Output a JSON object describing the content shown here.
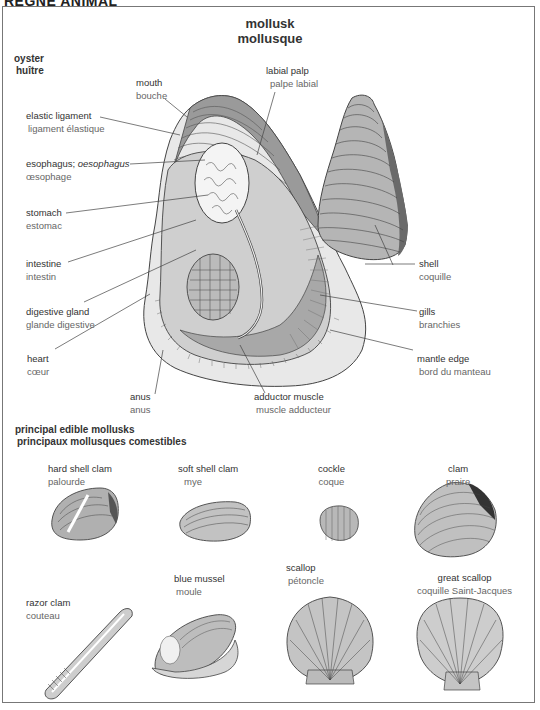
{
  "header": {
    "section": "RÈGNE ANIMAL"
  },
  "title": {
    "en": "mollusk",
    "fr": "mollusque"
  },
  "oyster": {
    "heading": {
      "en": "oyster",
      "fr": "huître"
    },
    "labels": [
      {
        "id": "mouth",
        "en": "mouth",
        "fr": "bouche"
      },
      {
        "id": "labial-palp",
        "en": "labial palp",
        "fr": "palpe labial"
      },
      {
        "id": "elastic-ligament",
        "en": "elastic ligament",
        "fr": "ligament élastique"
      },
      {
        "id": "esophagus",
        "en": "esophagus;",
        "en_alt": "oesophagus",
        "fr": "œsophage"
      },
      {
        "id": "stomach",
        "en": "stomach",
        "fr": "estomac"
      },
      {
        "id": "intestine",
        "en": "intestine",
        "fr": "intestin"
      },
      {
        "id": "digestive-gland",
        "en": "digestive gland",
        "fr": "glande digestive"
      },
      {
        "id": "heart",
        "en": "heart",
        "fr": "cœur"
      },
      {
        "id": "anus",
        "en": "anus",
        "fr": "anus"
      },
      {
        "id": "adductor-muscle",
        "en": "adductor muscle",
        "fr": "muscle adducteur"
      },
      {
        "id": "shell",
        "en": "shell",
        "fr": "coquille"
      },
      {
        "id": "gills",
        "en": "gills",
        "fr": "branchies"
      },
      {
        "id": "mantle-edge",
        "en": "mantle edge",
        "fr": "bord du manteau"
      }
    ]
  },
  "edible": {
    "heading": {
      "en": "principal edible mollusks",
      "fr": "principaux mollusques comestibles"
    },
    "items": [
      {
        "id": "hard-shell-clam",
        "en": "hard shell clam",
        "fr": "palourde"
      },
      {
        "id": "soft-shell-clam",
        "en": "soft shell clam",
        "fr": "mye"
      },
      {
        "id": "cockle",
        "en": "cockle",
        "fr": "coque"
      },
      {
        "id": "clam",
        "en": "clam",
        "fr": "praire"
      },
      {
        "id": "razor-clam",
        "en": "razor clam",
        "fr": "couteau"
      },
      {
        "id": "blue-mussel",
        "en": "blue mussel",
        "fr": "moule"
      },
      {
        "id": "scallop",
        "en": "scallop",
        "fr": "pétoncle"
      },
      {
        "id": "great-scallop",
        "en": "great scallop",
        "fr": "coquille Saint-Jacques"
      }
    ]
  },
  "colors": {
    "line": "#444444",
    "shell_fill": "#b9b9b9",
    "shell_dark": "#5a5a5a",
    "inner_fill": "#d4d4d4",
    "frame": "#777777"
  }
}
